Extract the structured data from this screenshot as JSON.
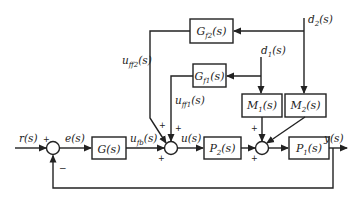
{
  "diagram": {
    "type": "control block diagram",
    "colors": {
      "line": "#222222",
      "background": "#ffffff"
    },
    "blocks": {
      "G": {
        "label": "G(s)"
      },
      "Gf1": {
        "label": "Gf1(s)",
        "main": "G",
        "sub": "f1",
        "tail": "(s)"
      },
      "Gf2": {
        "label": "Gf2(s)",
        "main": "G",
        "sub": "f2",
        "tail": "(s)"
      },
      "M1": {
        "label": "M1(s)",
        "main": "M",
        "sub": "1",
        "tail": "(s)"
      },
      "M2": {
        "label": "M2(s)",
        "main": "M",
        "sub": "2",
        "tail": "(s)"
      },
      "P1": {
        "label": "P1(s)",
        "main": "P",
        "sub": "1",
        "tail": "(s)"
      },
      "P2": {
        "label": "P2(s)",
        "main": "P",
        "sub": "2",
        "tail": "(s)"
      }
    },
    "signals": {
      "r": "r(s)",
      "e": "e(s)",
      "ufb": {
        "main": "u",
        "sub": "fb",
        "tail": "(s)"
      },
      "uff1": {
        "main": "u",
        "sub": "ff1",
        "tail": "(s)"
      },
      "uff2": {
        "main": "u",
        "sub": "ff2",
        "tail": "(s)"
      },
      "u": "u(s)",
      "y": "y(s)",
      "d1": {
        "main": "d",
        "sub": "1",
        "tail": "(s)"
      },
      "d2": {
        "main": "d",
        "sub": "2",
        "tail": "(s)"
      }
    },
    "signs": {
      "plus": "+",
      "minus": "−"
    }
  }
}
